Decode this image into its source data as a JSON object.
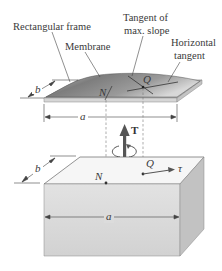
{
  "labels": {
    "rectangular_frame": "Rectangular frame",
    "membrane": "Membrane",
    "tangent_max_slope_line1": "Tangent of",
    "tangent_max_slope_line2": "max. slope",
    "horizontal_tangent_line1": "Horizontal",
    "horizontal_tangent_line2": "tangent",
    "dim_a_top": "a",
    "dim_b_top": "b",
    "point_N_top": "N",
    "point_Q_top": "Q",
    "torque": "T",
    "dim_a_bottom": "a",
    "dim_b_bottom": "b",
    "point_N_bottom": "N",
    "point_Q_bottom": "Q",
    "shear_stress": "τ"
  },
  "colors": {
    "membrane_dark": "#6f6f6f",
    "membrane_light": "#d4d4d4",
    "frame": "#cfcfcf",
    "bar_top": "#f4f4f4",
    "bar_front": "#d9d9d9",
    "bar_side": "#c4c4c4",
    "arrow": "#555555"
  }
}
